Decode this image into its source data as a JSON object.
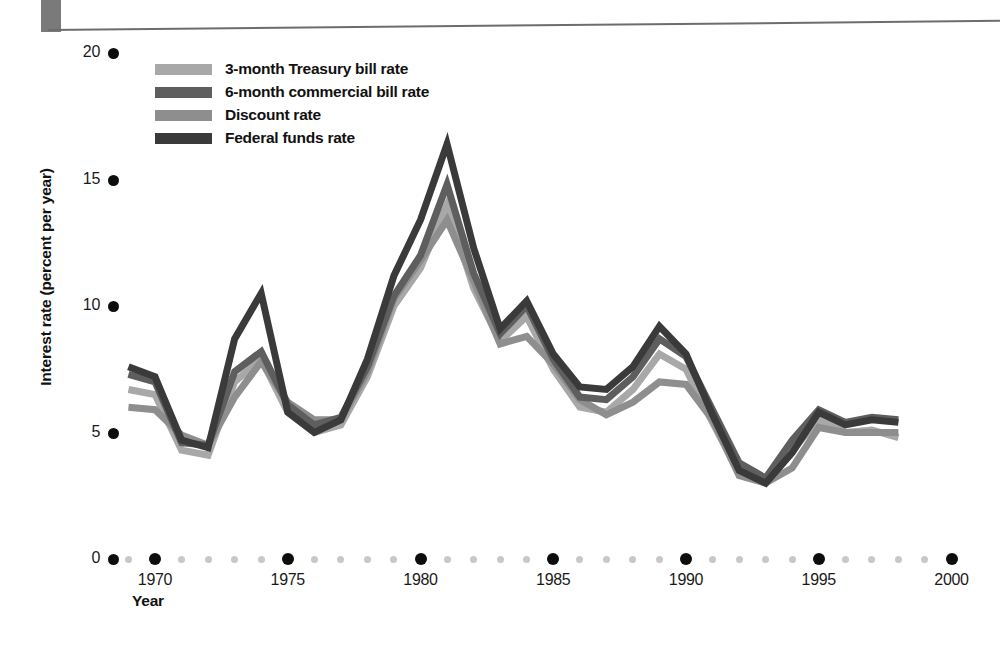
{
  "chart_data": {
    "type": "line",
    "title": "",
    "xlabel": "Year",
    "ylabel": "Interest rate (percent per year)",
    "xlim": [
      1969,
      2001
    ],
    "ylim": [
      0,
      20
    ],
    "yticks": [
      0,
      5,
      10,
      15,
      20
    ],
    "xticks": [
      1970,
      1975,
      1980,
      1985,
      1990,
      1995,
      2000
    ],
    "grid": false,
    "legend_position": "top-left-inside",
    "x": [
      1969,
      1970,
      1971,
      1972,
      1973,
      1974,
      1975,
      1976,
      1977,
      1978,
      1979,
      1980,
      1981,
      1982,
      1983,
      1984,
      1985,
      1986,
      1987,
      1988,
      1989,
      1990,
      1991,
      1992,
      1993,
      1994,
      1995,
      1996,
      1997,
      1998
    ],
    "series": [
      {
        "name": "3-month Treasury bill rate",
        "color": "#a8a8a8",
        "values": [
          6.7,
          6.5,
          4.3,
          4.1,
          7.0,
          7.9,
          5.8,
          5.0,
          5.3,
          7.2,
          10.0,
          11.5,
          14.0,
          10.7,
          8.6,
          9.6,
          7.5,
          6.0,
          5.8,
          6.7,
          8.1,
          7.5,
          5.4,
          3.4,
          3.0,
          4.3,
          5.5,
          5.0,
          5.1,
          4.8
        ],
        "marker": "none",
        "linewidth": 7
      },
      {
        "name": "6-month commercial bill rate",
        "color": "#5e5e5e",
        "values": [
          7.3,
          7.0,
          4.6,
          4.5,
          7.4,
          8.2,
          6.1,
          5.3,
          5.6,
          7.6,
          10.4,
          12.0,
          14.8,
          11.3,
          8.9,
          10.0,
          7.9,
          6.4,
          6.3,
          7.2,
          8.7,
          8.0,
          5.9,
          3.8,
          3.2,
          4.7,
          5.9,
          5.4,
          5.6,
          5.5
        ],
        "marker": "none",
        "linewidth": 7
      },
      {
        "name": "Discount rate",
        "color": "#8e8e8e",
        "values": [
          6.0,
          5.9,
          4.9,
          4.5,
          6.4,
          7.8,
          6.2,
          5.5,
          5.5,
          7.4,
          10.3,
          11.8,
          13.4,
          11.0,
          8.5,
          8.8,
          7.7,
          6.3,
          5.7,
          6.2,
          7.0,
          6.9,
          5.5,
          3.3,
          3.0,
          3.6,
          5.2,
          5.0,
          5.0,
          5.0
        ],
        "marker": "none",
        "linewidth": 7
      },
      {
        "name": "Federal funds rate",
        "color": "#3a3a3a",
        "values": [
          7.6,
          7.2,
          4.7,
          4.4,
          8.7,
          10.5,
          5.8,
          5.0,
          5.5,
          7.9,
          11.2,
          13.4,
          16.4,
          12.3,
          9.1,
          10.2,
          8.1,
          6.8,
          6.7,
          7.6,
          9.2,
          8.1,
          5.7,
          3.5,
          3.0,
          4.2,
          5.8,
          5.3,
          5.5,
          5.4
        ],
        "marker": "none",
        "linewidth": 7
      }
    ]
  },
  "legend": {
    "items": [
      {
        "label": "3-month Treasury bill rate",
        "color": "#a8a8a8"
      },
      {
        "label": "6-month commercial bill rate",
        "color": "#5e5e5e"
      },
      {
        "label": "Discount rate",
        "color": "#8e8e8e"
      },
      {
        "label": "Federal funds rate",
        "color": "#3a3a3a"
      }
    ]
  },
  "axes": {
    "y_title": "Interest rate (percent per year)",
    "x_title": "Year",
    "y_tick_labels": [
      "20",
      "15",
      "10",
      "5",
      "0"
    ],
    "x_tick_labels": [
      "1970",
      "1975",
      "1980",
      "1985",
      "1990",
      "1995",
      "2000"
    ]
  }
}
